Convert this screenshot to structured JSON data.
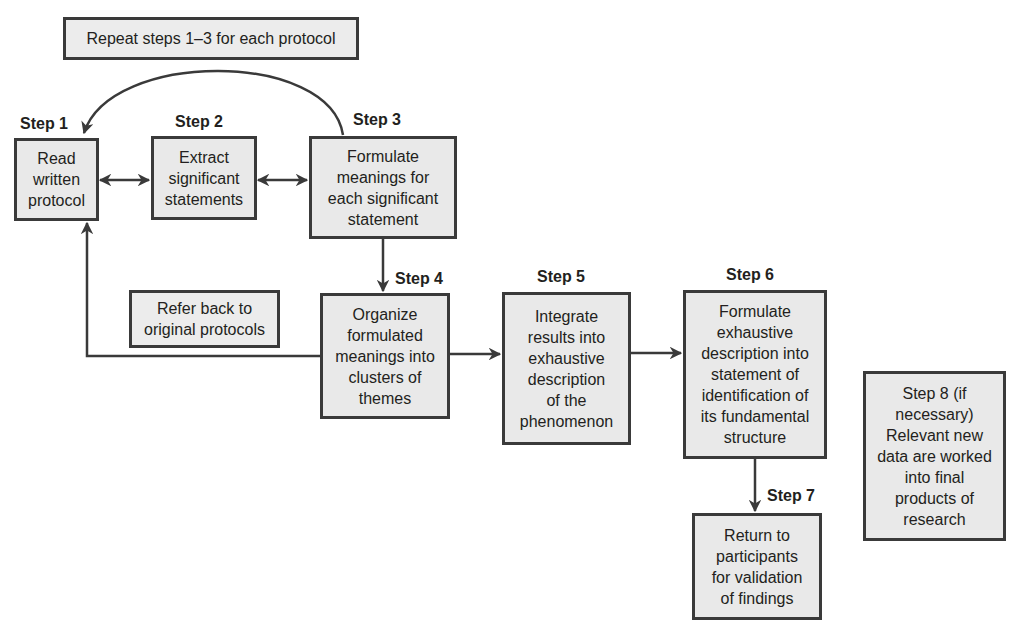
{
  "diagram": {
    "notes": {
      "repeat": "Repeat steps 1–3 for each protocol",
      "refer_back": "Refer back to\noriginal protocols"
    },
    "steps": [
      {
        "label": "Step 1",
        "text": "Read\nwritten\nprotocol"
      },
      {
        "label": "Step 2",
        "text": "Extract\nsignificant\nstatements"
      },
      {
        "label": "Step 3",
        "text": "Formulate\nmeanings for\neach significant\nstatement"
      },
      {
        "label": "Step 4",
        "text": "Organize\nformulated\nmeanings into\nclusters of\nthemes"
      },
      {
        "label": "Step 5",
        "text": "Integrate\nresults into\nexhaustive\ndescription\nof the\nphenomenon"
      },
      {
        "label": "Step 6",
        "text": "Formulate\nexhaustive\ndescription into\nstatement of\nidentification of\nits fundamental\nstructure"
      },
      {
        "label": "Step 7",
        "text": "Return to\nparticipants\nfor validation\nof findings"
      },
      {
        "label": "",
        "text": "Step 8 (if\nnecessary)\nRelevant new\ndata are worked\ninto final\nproducts of\nresearch"
      }
    ],
    "connections": [
      {
        "from": "Step 1",
        "to": "Step 2",
        "type": "bidirectional"
      },
      {
        "from": "Step 2",
        "to": "Step 3",
        "type": "bidirectional"
      },
      {
        "from": "Step 3",
        "to": "Step 1",
        "type": "curved-arrow",
        "note": "Repeat steps 1–3 for each protocol"
      },
      {
        "from": "Step 3",
        "to": "Step 4",
        "type": "arrow"
      },
      {
        "from": "Step 4",
        "to": "Step 1",
        "type": "arrow",
        "note": "Refer back to original protocols"
      },
      {
        "from": "Step 4",
        "to": "Step 5",
        "type": "arrow"
      },
      {
        "from": "Step 5",
        "to": "Step 6",
        "type": "arrow"
      },
      {
        "from": "Step 6",
        "to": "Step 7",
        "type": "arrow"
      }
    ],
    "colors": {
      "box_fill": "#e9e9e9",
      "box_border": "#3a3a3a",
      "line": "#3a3a3a",
      "text": "#231f20",
      "background": "#ffffff"
    }
  }
}
